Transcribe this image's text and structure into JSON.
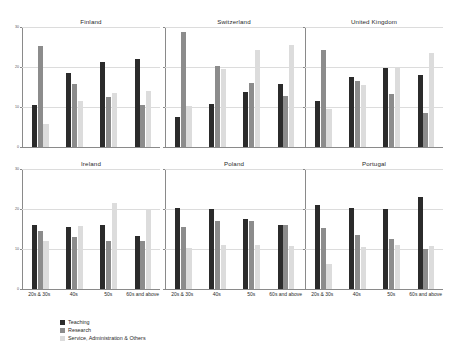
{
  "chart_data": {
    "type": "bar",
    "title": "",
    "xlabel": "",
    "ylabel": "",
    "ylim": [
      0,
      30
    ],
    "yticks": [
      0,
      10,
      20,
      30
    ],
    "ytick_labels": [
      "0",
      "10",
      "20",
      "30"
    ],
    "grid": true,
    "legend_position": "bottom-center",
    "categories": [
      "20s & 30s",
      "40s",
      "50s",
      "60s and above"
    ],
    "series_names": [
      "Teaching",
      "Research",
      "Service, Administration & Others"
    ],
    "series_colors": [
      "#2b2b2b",
      "#8c8c8c",
      "#dcdcdc"
    ],
    "panels": [
      {
        "title": "Finland",
        "series": [
          {
            "name": "Teaching",
            "values": [
              10.4,
              18.6,
              21.3,
              22.0
            ]
          },
          {
            "name": "Research",
            "values": [
              25.2,
              15.8,
              12.6,
              10.6
            ]
          },
          {
            "name": "Service, Administration & Others",
            "values": [
              5.8,
              11.4,
              13.4,
              14.1
            ]
          }
        ]
      },
      {
        "title": "Switzerland",
        "series": [
          {
            "name": "Teaching",
            "values": [
              7.6,
              10.8,
              13.8,
              15.8
            ]
          },
          {
            "name": "Research",
            "values": [
              28.8,
              20.2,
              15.9,
              12.7
            ]
          },
          {
            "name": "Service, Administration & Others",
            "values": [
              10.2,
              19.5,
              24.2,
              25.4
            ]
          }
        ]
      },
      {
        "title": "United Kingdom",
        "series": [
          {
            "name": "Teaching",
            "values": [
              11.4,
              17.5,
              19.7,
              17.9
            ]
          },
          {
            "name": "Research",
            "values": [
              24.3,
              16.4,
              13.2,
              8.6
            ]
          },
          {
            "name": "Service, Administration & Others",
            "values": [
              9.5,
              15.6,
              20.0,
              23.4
            ]
          }
        ]
      },
      {
        "title": "Ireland",
        "series": [
          {
            "name": "Teaching",
            "values": [
              16.0,
              15.4,
              16.1,
              13.3
            ]
          },
          {
            "name": "Research",
            "values": [
              14.4,
              13.0,
              12.1,
              12.1
            ]
          },
          {
            "name": "Service, Administration & Others",
            "values": [
              12.1,
              15.7,
              21.6,
              19.9
            ]
          }
        ]
      },
      {
        "title": "Poland",
        "series": [
          {
            "name": "Teaching",
            "values": [
              20.2,
              19.9,
              17.4,
              16.1
            ]
          },
          {
            "name": "Research",
            "values": [
              15.4,
              17.0,
              17.0,
              16.1
            ]
          },
          {
            "name": "Service, Administration & Others",
            "values": [
              10.2,
              11.0,
              11.1,
              10.8
            ]
          }
        ]
      },
      {
        "title": "Portugal",
        "series": [
          {
            "name": "Teaching",
            "values": [
              21.0,
              20.3,
              19.9,
              23.0
            ]
          },
          {
            "name": "Research",
            "values": [
              15.2,
              13.6,
              12.6,
              10.1
            ]
          },
          {
            "name": "Service, Administration & Others",
            "values": [
              6.3,
              10.5,
              11.0,
              10.8
            ]
          }
        ]
      }
    ]
  }
}
